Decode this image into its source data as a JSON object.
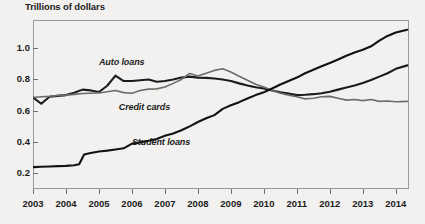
{
  "chart_data": {
    "type": "line",
    "title": "Trillions of dollars",
    "xlabel": "",
    "ylabel": "Trillions of dollars",
    "xlim": [
      2003.0,
      2014.4
    ],
    "ylim": [
      0.1,
      1.18
    ],
    "grid": false,
    "legend_position": "inline-annotations",
    "xtick_labels": [
      "2003",
      "2004",
      "2005",
      "2006",
      "2007",
      "2008",
      "2009",
      "2010",
      "2011",
      "2012",
      "2013",
      "2014"
    ],
    "xtick_values": [
      2003,
      2004,
      2005,
      2006,
      2007,
      2008,
      2009,
      2010,
      2011,
      2012,
      2013,
      2014
    ],
    "ytick_labels": [
      "0.2",
      "0.4",
      "0.6",
      "0.8",
      "1.0"
    ],
    "ytick_values": [
      0.2,
      0.4,
      0.6,
      0.8,
      1.0
    ],
    "series": [
      {
        "name": "Auto loans",
        "color": "#1c1c1c",
        "label_x": 2005.0,
        "label_y": 0.905,
        "x": [
          2003.0,
          2003.25,
          2003.5,
          2003.75,
          2004.0,
          2004.25,
          2004.5,
          2004.75,
          2005.0,
          2005.25,
          2005.5,
          2005.75,
          2006.0,
          2006.25,
          2006.5,
          2006.75,
          2007.0,
          2007.25,
          2007.5,
          2007.75,
          2008.0,
          2008.25,
          2008.5,
          2008.75,
          2009.0,
          2009.25,
          2009.5,
          2009.75,
          2010.0,
          2010.25,
          2010.5,
          2010.75,
          2011.0,
          2011.25,
          2011.5,
          2011.75,
          2012.0,
          2012.25,
          2012.5,
          2012.75,
          2013.0,
          2013.25,
          2013.5,
          2013.75,
          2014.0,
          2014.35
        ],
        "y": [
          0.685,
          0.645,
          0.69,
          0.695,
          0.7,
          0.715,
          0.735,
          0.73,
          0.72,
          0.76,
          0.825,
          0.79,
          0.79,
          0.795,
          0.8,
          0.785,
          0.79,
          0.8,
          0.812,
          0.818,
          0.812,
          0.81,
          0.806,
          0.8,
          0.79,
          0.775,
          0.762,
          0.75,
          0.742,
          0.73,
          0.718,
          0.71,
          0.7,
          0.702,
          0.706,
          0.712,
          0.722,
          0.735,
          0.748,
          0.762,
          0.778,
          0.796,
          0.818,
          0.84,
          0.868,
          0.89
        ]
      },
      {
        "name": "Credit cards",
        "color": "#6c6c6a",
        "label_x": 2005.6,
        "label_y": 0.615,
        "x": [
          2003.0,
          2003.25,
          2003.5,
          2003.75,
          2004.0,
          2004.25,
          2004.5,
          2004.75,
          2005.0,
          2005.25,
          2005.5,
          2005.75,
          2006.0,
          2006.25,
          2006.5,
          2006.75,
          2007.0,
          2007.25,
          2007.5,
          2007.75,
          2008.0,
          2008.25,
          2008.5,
          2008.75,
          2009.0,
          2009.25,
          2009.5,
          2009.75,
          2010.0,
          2010.25,
          2010.5,
          2010.75,
          2011.0,
          2011.25,
          2011.5,
          2011.75,
          2012.0,
          2012.25,
          2012.5,
          2012.75,
          2013.0,
          2013.25,
          2013.5,
          2013.75,
          2014.0,
          2014.35
        ],
        "y": [
          0.685,
          0.69,
          0.692,
          0.698,
          0.7,
          0.705,
          0.71,
          0.712,
          0.714,
          0.722,
          0.73,
          0.716,
          0.712,
          0.73,
          0.738,
          0.74,
          0.752,
          0.775,
          0.8,
          0.838,
          0.822,
          0.84,
          0.858,
          0.868,
          0.848,
          0.82,
          0.795,
          0.77,
          0.752,
          0.73,
          0.712,
          0.7,
          0.69,
          0.676,
          0.68,
          0.69,
          0.692,
          0.68,
          0.668,
          0.672,
          0.665,
          0.672,
          0.66,
          0.662,
          0.658,
          0.66
        ]
      },
      {
        "name": "Student loans",
        "color": "#121212",
        "label_x": 2006.0,
        "label_y": 0.395,
        "x": [
          2003.0,
          2003.25,
          2003.5,
          2003.75,
          2004.0,
          2004.25,
          2004.4,
          2004.55,
          2004.75,
          2005.0,
          2005.25,
          2005.5,
          2005.75,
          2006.0,
          2006.25,
          2006.5,
          2006.75,
          2007.0,
          2007.25,
          2007.5,
          2007.75,
          2008.0,
          2008.25,
          2008.5,
          2008.75,
          2009.0,
          2009.25,
          2009.5,
          2009.75,
          2010.0,
          2010.25,
          2010.5,
          2010.75,
          2011.0,
          2011.25,
          2011.5,
          2011.75,
          2012.0,
          2012.25,
          2012.5,
          2012.75,
          2013.0,
          2013.25,
          2013.5,
          2013.75,
          2014.0,
          2014.35
        ],
        "y": [
          0.24,
          0.242,
          0.244,
          0.246,
          0.248,
          0.252,
          0.258,
          0.32,
          0.33,
          0.34,
          0.345,
          0.352,
          0.36,
          0.39,
          0.398,
          0.408,
          0.42,
          0.44,
          0.455,
          0.475,
          0.5,
          0.528,
          0.552,
          0.572,
          0.612,
          0.635,
          0.655,
          0.678,
          0.7,
          0.718,
          0.742,
          0.768,
          0.79,
          0.812,
          0.84,
          0.862,
          0.884,
          0.905,
          0.928,
          0.952,
          0.972,
          0.99,
          1.012,
          1.048,
          1.078,
          1.1,
          1.118
        ]
      }
    ]
  }
}
